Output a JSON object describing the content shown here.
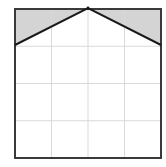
{
  "diagram": {
    "type": "geometry-grid-shaded-region",
    "grid": {
      "rows": 4,
      "cols": 4,
      "left": 15,
      "top": 9,
      "right": 161,
      "bottom": 158,
      "line_color": "#d9d9d9",
      "border_color": "#3a3a3a"
    },
    "peak": {
      "x": 88,
      "y": 8
    },
    "left_join": {
      "x": 15,
      "y": 45
    },
    "right_join": {
      "x": 161,
      "y": 45
    },
    "shaded_regions": [
      {
        "name": "top-left-triangle",
        "points": [
          [
            15,
            9
          ],
          [
            88,
            8
          ],
          [
            15,
            45
          ]
        ]
      },
      {
        "name": "top-right-triangle",
        "points": [
          [
            88,
            8
          ],
          [
            161,
            9
          ],
          [
            161,
            45
          ]
        ]
      }
    ],
    "colors": {
      "shade": "#d4d4d4",
      "roof_line": "#1a1a1a",
      "background": "#ffffff"
    }
  }
}
